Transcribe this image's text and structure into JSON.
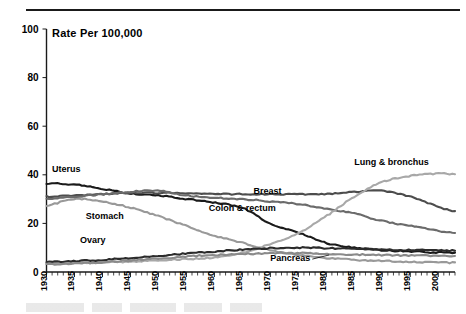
{
  "chart_data": {
    "type": "line",
    "title": "Rate Per 100,000",
    "xlabel": "",
    "ylabel": "",
    "xlim": [
      1930,
      2003
    ],
    "ylim": [
      0,
      100
    ],
    "yticks": [
      0,
      20,
      40,
      60,
      80,
      100
    ],
    "xticks": [
      1930,
      1935,
      1940,
      1945,
      1950,
      1955,
      1960,
      1965,
      1970,
      1975,
      1980,
      1985,
      1990,
      1995,
      2000
    ],
    "grid": false,
    "legend_position": "inline-annotations",
    "x": [
      1930,
      1935,
      1940,
      1945,
      1950,
      1955,
      1960,
      1965,
      1970,
      1975,
      1980,
      1985,
      1990,
      1995,
      2000,
      2003
    ],
    "series": [
      {
        "name": "Uterus",
        "label": "Uterus",
        "color": "#1a1a1a",
        "label_x": 1931,
        "label_y": 41,
        "values": [
          36.4,
          36.0,
          34.3,
          32.4,
          31.5,
          30.0,
          28.5,
          26.4,
          20.0,
          16.2,
          12.0,
          10.0,
          9.0,
          8.5,
          8.0,
          7.9
        ]
      },
      {
        "name": "Stomach",
        "label": "Stomach",
        "color": "#999999",
        "label_x": 1937,
        "label_y": 22,
        "values": [
          27.4,
          30.0,
          29.0,
          26.5,
          23.0,
          19.0,
          15.0,
          12.0,
          9.0,
          7.0,
          5.8,
          5.0,
          4.6,
          4.2,
          3.9,
          3.8
        ]
      },
      {
        "name": "Breast",
        "label": "Breast",
        "color": "#4d4d4d",
        "label_x": 1967,
        "label_y": 32,
        "values": [
          31.0,
          31.5,
          32.0,
          32.5,
          32.6,
          32.5,
          32.2,
          32.0,
          32.0,
          32.0,
          32.0,
          33.0,
          33.4,
          31.0,
          27.0,
          25.0
        ]
      },
      {
        "name": "Colon & rectum",
        "label": "Colon & rectum",
        "color": "#6b6b6b",
        "label_x": 1959,
        "label_y": 25,
        "values": [
          30.0,
          31.0,
          32.0,
          33.0,
          33.5,
          31.5,
          30.5,
          30.0,
          29.0,
          28.0,
          26.0,
          24.0,
          21.0,
          19.0,
          17.0,
          16.0
        ]
      },
      {
        "name": "Lung & bronchus",
        "label": "Lung & bronchus",
        "color": "#a8a8a8",
        "label_x": 1985,
        "label_y": 44,
        "values": [
          3.5,
          3.7,
          4.0,
          4.3,
          4.8,
          5.3,
          6.0,
          8.0,
          11.5,
          16.0,
          23.0,
          31.0,
          37.0,
          39.5,
          40.5,
          40.3
        ]
      },
      {
        "name": "Ovary",
        "label": "Ovary",
        "color": "#2b2b2b",
        "label_x": 1936,
        "label_y": 12,
        "values": [
          4.2,
          4.5,
          5.0,
          5.8,
          6.7,
          7.6,
          8.4,
          9.2,
          9.8,
          10.0,
          9.8,
          9.5,
          9.3,
          9.0,
          8.9,
          8.8
        ]
      },
      {
        "name": "Pancreas",
        "label": "Pancreas",
        "color": "#8a8a8a",
        "label_x": 1970,
        "label_y": 4.5,
        "values": [
          3.2,
          3.5,
          4.0,
          4.8,
          5.6,
          6.4,
          7.0,
          7.4,
          7.7,
          7.8,
          7.5,
          7.2,
          7.0,
          6.8,
          6.7,
          6.6
        ]
      }
    ]
  }
}
